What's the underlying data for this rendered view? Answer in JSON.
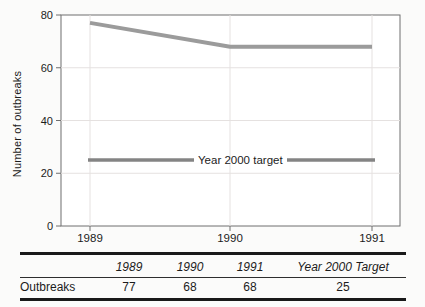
{
  "chart_data": {
    "type": "line",
    "categories": [
      "1989",
      "1990",
      "1991"
    ],
    "series": [
      {
        "name": "Outbreaks",
        "values": [
          77,
          68,
          68
        ]
      },
      {
        "name": "Year 2000 target",
        "values": [
          25,
          25,
          25
        ]
      }
    ],
    "target_label": "Year 2000 target",
    "title": "",
    "xlabel": "",
    "ylabel": "Number of outbreaks",
    "ylim": [
      0,
      80
    ],
    "yticks": [
      0,
      20,
      40,
      60,
      80
    ],
    "grid": true,
    "legend_position": "inline-label-on-target-line"
  },
  "table": {
    "columns": [
      "1989",
      "1990",
      "1991",
      "Year 2000 Target"
    ],
    "rows": [
      {
        "label": "Outbreaks",
        "values": [
          "77",
          "68",
          "68",
          "25"
        ]
      }
    ]
  },
  "colors": {
    "outbreaks_line": "#9b9b9b",
    "target_line": "#848484",
    "grid_line": "#e5e1e0",
    "axis": "#6f6f6f",
    "text": "#1c1c1c",
    "table_rule": "#191919",
    "plot_background": "#ffffff",
    "page_background": "#fbfbfa"
  }
}
